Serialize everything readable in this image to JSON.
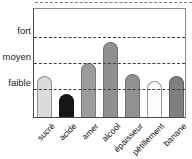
{
  "chart_data": {
    "type": "bar",
    "title": "",
    "categories": [
      "sucré",
      "acide",
      "amer",
      "alcool",
      "épaisseur",
      "pétillement",
      "banane"
    ],
    "values": [
      1.4,
      0.7,
      1.9,
      2.7,
      1.5,
      1.2,
      1.4
    ],
    "value_scale_note": "qualitative scale: faible=1, moyen=2, fort=3",
    "y_ticks": [
      {
        "label": "fort",
        "value": 3
      },
      {
        "label": "moyen",
        "value": 2
      },
      {
        "label": "faible",
        "value": 1
      }
    ],
    "ylim": [
      0,
      3.8
    ],
    "grid": "horizontal dashed lines at faible/moyen/fort, drawn over bars",
    "legend": "none",
    "bar_styles": [
      {
        "fill": "#dbdbd7",
        "border": "#8f8f8f"
      },
      {
        "fill": "#161616",
        "border": "#161616"
      },
      {
        "fill": "#9c9c9c",
        "border": "#7a7a7a"
      },
      {
        "fill": "#909090",
        "border": "#6f6f6f"
      },
      {
        "fill": "#919191",
        "border": "#6f6f6f"
      },
      {
        "fill": "#fcfcfc",
        "border": "#9a9a9a"
      },
      {
        "fill": "#7f7f7f",
        "border": "#5f5f5f"
      }
    ]
  }
}
